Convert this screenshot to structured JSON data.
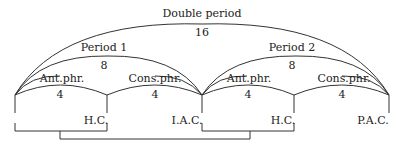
{
  "diagram": {
    "double_period": {
      "label": "Double period",
      "measures": "16"
    },
    "periods": [
      {
        "label": "Period 1",
        "measures": "8"
      },
      {
        "label": "Period 2",
        "measures": "8"
      }
    ],
    "phrases": [
      {
        "label": "Ant.phr.",
        "measures": "4",
        "cadence": "H.C."
      },
      {
        "label": "Cons.phr.",
        "measures": "4",
        "cadence": "I.A.C."
      },
      {
        "label": "Ant.phr.",
        "measures": "4",
        "cadence": "H.C."
      },
      {
        "label": "Cons.phr.",
        "measures": "4",
        "cadence": "P.A.C."
      }
    ],
    "colors": {
      "line": "#333333",
      "text": "#222222",
      "background": "#ffffff"
    }
  }
}
